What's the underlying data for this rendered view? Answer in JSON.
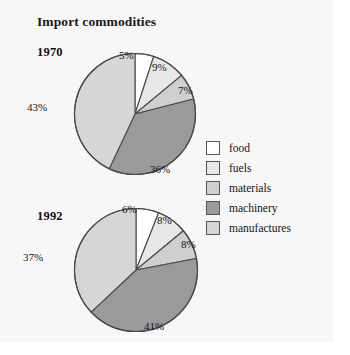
{
  "figure": {
    "title": "Import commodities",
    "background": "#f7f7f7"
  },
  "legend": {
    "position": "right-middle",
    "items": [
      {
        "label": "food",
        "color": "#ffffff"
      },
      {
        "label": "fuels",
        "color": "#e8e8e8"
      },
      {
        "label": "materials",
        "color": "#cfcfcf"
      },
      {
        "label": "machinery",
        "color": "#9a9a9a"
      },
      {
        "label": "manufactures",
        "color": "#d6d6d6"
      }
    ]
  },
  "chart_data": [
    {
      "type": "pie",
      "title": "1970",
      "labels": [
        "food",
        "fuels",
        "materials",
        "machinery",
        "manufactures"
      ],
      "values": [
        5,
        9,
        7,
        36,
        43
      ],
      "value_labels": [
        "5%",
        "9%",
        "7%",
        "36%",
        "43%"
      ],
      "colors": [
        "#ffffff",
        "#e8e8e8",
        "#cfcfcf",
        "#9a9a9a",
        "#d6d6d6"
      ],
      "start_angle_deg": 0,
      "direction": "clockwise"
    },
    {
      "type": "pie",
      "title": "1992",
      "labels": [
        "food",
        "fuels",
        "materials",
        "machinery",
        "manufactures"
      ],
      "values": [
        6,
        8,
        8,
        41,
        37
      ],
      "value_labels": [
        "6%",
        "8%",
        "8%",
        "41%",
        "37%"
      ],
      "colors": [
        "#ffffff",
        "#e8e8e8",
        "#cfcfcf",
        "#9a9a9a",
        "#d6d6d6"
      ],
      "start_angle_deg": 0,
      "direction": "clockwise"
    }
  ],
  "pie_1970_labels": {
    "food": "5%",
    "fuels": "9%",
    "materials": "7%",
    "machinery": "36%",
    "manufactures": "43%"
  },
  "pie_1992_labels": {
    "food": "6%",
    "fuels": "8%",
    "materials": "8%",
    "machinery": "41%",
    "manufactures": "37%"
  },
  "years": {
    "first": "1970",
    "second": "1992"
  }
}
